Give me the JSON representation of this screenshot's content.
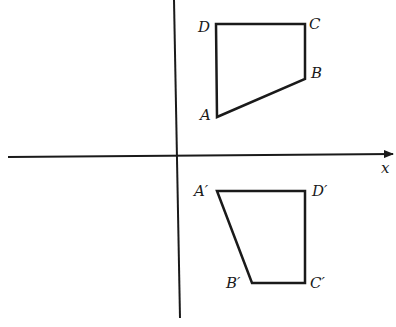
{
  "axes": {
    "x_label": "x",
    "origin": [
      177,
      156
    ]
  },
  "quadrilateral_original": {
    "name": "ABCD",
    "vertices": [
      {
        "label": "A",
        "x": 217,
        "y": 117
      },
      {
        "label": "B",
        "x": 305,
        "y": 79
      },
      {
        "label": "C",
        "x": 305,
        "y": 24
      },
      {
        "label": "D",
        "x": 216,
        "y": 24
      }
    ]
  },
  "quadrilateral_image": {
    "name": "A'B'C'D'",
    "vertices": [
      {
        "label": "A′",
        "x": 217,
        "y": 191
      },
      {
        "label": "B′",
        "x": 252,
        "y": 283
      },
      {
        "label": "C′",
        "x": 305,
        "y": 283
      },
      {
        "label": "D′",
        "x": 305,
        "y": 191
      }
    ]
  },
  "colors": {
    "stroke": "#1a1a1a",
    "background": "#ffffff"
  }
}
